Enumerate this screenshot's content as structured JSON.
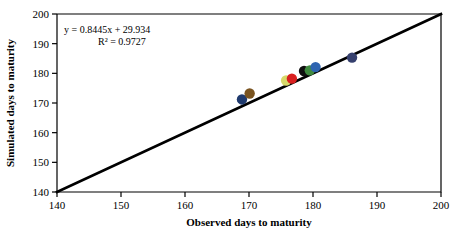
{
  "chart_data": {
    "type": "scatter",
    "title": "",
    "xlabel": "Observed days to maturity",
    "ylabel": "Simulated days to maturity",
    "xlim": [
      140,
      200
    ],
    "ylim": [
      140,
      200
    ],
    "xticks": [
      140,
      150,
      160,
      170,
      180,
      190,
      200
    ],
    "yticks": [
      140,
      150,
      160,
      170,
      180,
      190,
      200
    ],
    "grid": false,
    "legend": "none",
    "annotations": {
      "equation": "y = 0.8445x + 29.934",
      "r_squared": "R² = 0.9727",
      "slope": 0.8445,
      "intercept": 29.934,
      "r2": 0.9727
    },
    "reference_line": {
      "name": "1:1 line",
      "from": [
        140,
        140
      ],
      "to": [
        200,
        200
      ],
      "color": "#000000"
    },
    "points": [
      {
        "x": 168.9,
        "y": 171.2,
        "color": "#1f3a6e"
      },
      {
        "x": 170.1,
        "y": 173.2,
        "color": "#7a5420"
      },
      {
        "x": 175.8,
        "y": 177.6,
        "color": "#d7d96a"
      },
      {
        "x": 176.7,
        "y": 178.2,
        "color": "#d92020"
      },
      {
        "x": 178.6,
        "y": 180.8,
        "color": "#101010"
      },
      {
        "x": 179.5,
        "y": 181.0,
        "color": "#3f8a3f"
      },
      {
        "x": 180.4,
        "y": 182.1,
        "color": "#2e64b0"
      },
      {
        "x": 186.1,
        "y": 185.3,
        "color": "#36406e"
      }
    ]
  },
  "axes": {
    "x_tick_labels": [
      "140",
      "150",
      "160",
      "170",
      "180",
      "190",
      "200"
    ],
    "y_tick_labels": [
      "140",
      "150",
      "160",
      "170",
      "180",
      "190",
      "200"
    ],
    "x_axis_title": "Observed days to maturity",
    "y_axis_title": "Simulated days to maturity"
  },
  "annotation_text": {
    "line1": "y = 0.8445x + 29.934",
    "line2": "R² = 0.9727"
  },
  "colors": {
    "axis": "#000000",
    "reference_line": "#000000",
    "background": "#ffffff"
  }
}
